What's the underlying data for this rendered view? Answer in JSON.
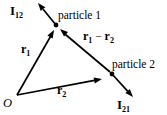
{
  "figure": {
    "background_color": "#ffffff",
    "ink_color": "#000000",
    "origin_label": "O",
    "particles": [
      {
        "label": "particle 1"
      },
      {
        "label": "particle 2"
      }
    ],
    "vectors": {
      "r1": {
        "main": "r",
        "sub": "1"
      },
      "r2": {
        "main": "r",
        "sub": "2"
      },
      "r1_minus_r2": {
        "left_main": "r",
        "left_sub": "1",
        "operator": "−",
        "right_main": "r",
        "right_sub": "2"
      },
      "impulse_on_1": {
        "main": "I",
        "sub": "12"
      },
      "impulse_on_2": {
        "main": "I",
        "sub": "21"
      }
    }
  }
}
